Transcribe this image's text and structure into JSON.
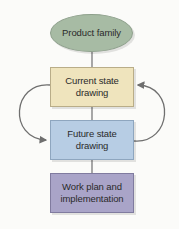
{
  "diagram": {
    "type": "flowchart",
    "nodes": [
      {
        "id": "product_family",
        "shape": "ellipse",
        "label": "Product family",
        "color": "#a7bba4"
      },
      {
        "id": "current_state",
        "shape": "rectangle",
        "label_line1": "Current state",
        "label_line2": "drawing",
        "color": "#efe4bd"
      },
      {
        "id": "future_state",
        "shape": "rectangle",
        "label_line1": "Future state",
        "label_line2": "drawing",
        "color": "#b7cde4"
      },
      {
        "id": "work_plan",
        "shape": "rectangle",
        "label_line1": "Work plan and",
        "label_line2": "implementation",
        "color": "#a9a4c8"
      }
    ],
    "edges": [
      {
        "from": "product_family",
        "to": "current_state",
        "style": "line"
      },
      {
        "from": "current_state",
        "to": "future_state",
        "style": "line"
      },
      {
        "from": "future_state",
        "to": "work_plan",
        "style": "line"
      },
      {
        "from": "current_state",
        "to": "future_state",
        "style": "curved-arrow",
        "side": "left"
      },
      {
        "from": "future_state",
        "to": "current_state",
        "style": "curved-arrow",
        "side": "right"
      }
    ],
    "line_color": "#6f6f6f"
  }
}
